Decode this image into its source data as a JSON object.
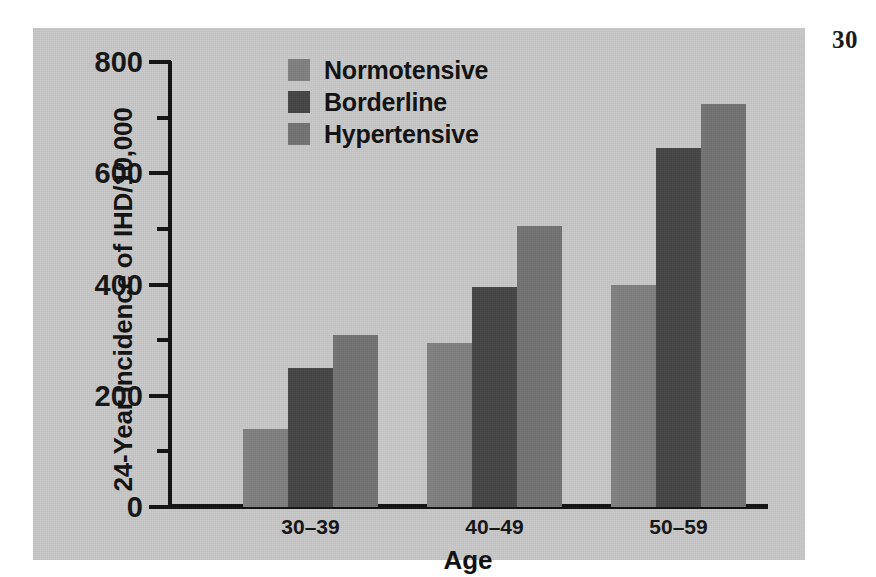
{
  "page": {
    "folio": "30",
    "background_color": "#ffffff",
    "panel_color": "#c8c8c8"
  },
  "chart_data": {
    "type": "bar",
    "title": "",
    "xlabel": "Age",
    "ylabel": "24-Year Incidence of IHD/10,000",
    "categories": [
      "30–39",
      "40–49",
      "50–59"
    ],
    "series": [
      {
        "name": "Normotensive",
        "color": "#808080",
        "values": [
          140,
          295,
          400
        ]
      },
      {
        "name": "Borderline",
        "color": "#454545",
        "values": [
          250,
          395,
          645
        ]
      },
      {
        "name": "Hypertensive",
        "color": "#737373",
        "values": [
          310,
          505,
          725
        ]
      }
    ],
    "ylim": [
      0,
      800
    ],
    "ytick_labels": [
      "0",
      "200",
      "400",
      "600",
      "800"
    ],
    "ytick_values": [
      0,
      200,
      400,
      600,
      800
    ],
    "yminor_tick_values": [
      100,
      300,
      500,
      700
    ],
    "grid": false,
    "legend_position": "top-left-inside",
    "legend_entries": [
      "Normotensive",
      "Borderline",
      "Hypertensive"
    ],
    "axis_color": "#111111"
  }
}
